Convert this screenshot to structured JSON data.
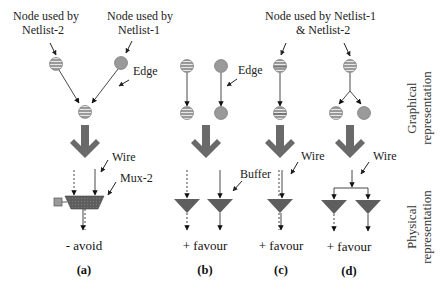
{
  "labels": {
    "node_netlist2": [
      "Node used by",
      "Netlist-2"
    ],
    "node_netlist1": [
      "Node used by",
      "Netlist-1"
    ],
    "node_both": [
      "Node used by Netlist-1",
      "& Netlist-2"
    ],
    "edge": "Edge",
    "wire": "Wire",
    "mux": "Mux-2",
    "buffer": "Buffer"
  },
  "side_labels": {
    "graphical": [
      "Graphical",
      "representation"
    ],
    "physical": [
      "Physical",
      "representation"
    ]
  },
  "panels": [
    {
      "id": "a",
      "verdict": "- avoid",
      "caption": "(a)"
    },
    {
      "id": "b",
      "verdict": "+ favour",
      "caption": "(b)"
    },
    {
      "id": "c",
      "verdict": "+ favour",
      "caption": "(c)"
    },
    {
      "id": "d",
      "verdict": "+ favour",
      "caption": "(d)"
    }
  ],
  "colors": {
    "node_fill": "#9a9a9a",
    "stripe": "#e6e6e6",
    "gate_fill": "#5e5e5e",
    "arrow_fill": "#6a6a6a",
    "line": "#333333"
  }
}
